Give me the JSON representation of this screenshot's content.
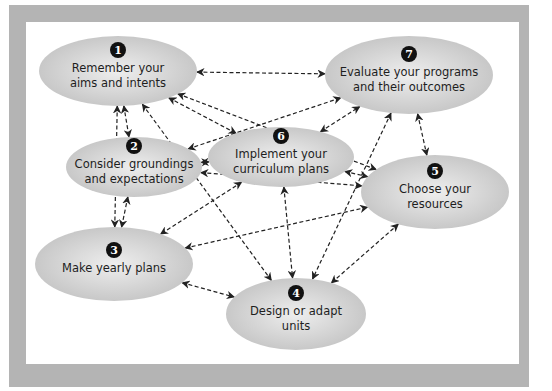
{
  "diagram": {
    "type": "cyclical curriculum planning network",
    "nodes": [
      {
        "id": 1,
        "number": "1",
        "lines": [
          "Remember your",
          "aims and intents"
        ]
      },
      {
        "id": 2,
        "number": "2",
        "lines": [
          "Consider groundings",
          "and expectations"
        ]
      },
      {
        "id": 3,
        "number": "3",
        "lines": [
          "Make yearly plans"
        ]
      },
      {
        "id": 4,
        "number": "4",
        "lines": [
          "Design or adapt",
          "units"
        ]
      },
      {
        "id": 5,
        "number": "5",
        "lines": [
          "Choose your",
          "resources"
        ]
      },
      {
        "id": 6,
        "number": "6",
        "lines": [
          "Implement your",
          "curriculum plans"
        ]
      },
      {
        "id": 7,
        "number": "7",
        "lines": [
          "Evaluate your programs",
          "and their outcomes"
        ]
      }
    ],
    "edges": [
      {
        "from": 1,
        "to": 7,
        "bidirectional": true
      },
      {
        "from": 1,
        "to": 2,
        "bidirectional": true
      },
      {
        "from": 1,
        "to": 3,
        "bidirectional": true
      },
      {
        "from": 1,
        "to": 6,
        "bidirectional": true
      },
      {
        "from": 1,
        "to": 5,
        "bidirectional": true
      },
      {
        "from": 1,
        "to": 4,
        "bidirectional": true
      },
      {
        "from": 2,
        "to": 6,
        "bidirectional": true
      },
      {
        "from": 2,
        "to": 7,
        "bidirectional": true
      },
      {
        "from": 2,
        "to": 3,
        "bidirectional": true
      },
      {
        "from": 2,
        "to": 5,
        "bidirectional": true
      },
      {
        "from": 6,
        "to": 7,
        "bidirectional": true
      },
      {
        "from": 6,
        "to": 3,
        "bidirectional": true
      },
      {
        "from": 6,
        "to": 5,
        "bidirectional": true
      },
      {
        "from": 6,
        "to": 4,
        "bidirectional": true
      },
      {
        "from": 7,
        "to": 5,
        "bidirectional": true
      },
      {
        "from": 7,
        "to": 4,
        "bidirectional": true
      },
      {
        "from": 3,
        "to": 5,
        "bidirectional": true
      },
      {
        "from": 3,
        "to": 4,
        "bidirectional": true
      },
      {
        "from": 5,
        "to": 4,
        "bidirectional": true
      }
    ]
  },
  "colors": {
    "frame": "#b4b4b4",
    "node_fill_center": "#ededed",
    "node_fill_edge": "#c6c6c6",
    "number_badge": "#111111",
    "arrow": "#222222"
  }
}
